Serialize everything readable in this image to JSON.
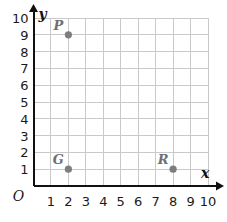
{
  "chart_data": {
    "type": "scatter",
    "title": "",
    "xlabel": "x",
    "ylabel": "y",
    "origin_label": "O",
    "xlim": [
      0,
      10
    ],
    "ylim": [
      0,
      10
    ],
    "grid": true,
    "legend": "none",
    "x_ticks": [
      "1",
      "2",
      "3",
      "4",
      "5",
      "6",
      "7",
      "8",
      "9",
      "10"
    ],
    "y_ticks": [
      "1",
      "2",
      "3",
      "4",
      "5",
      "6",
      "7",
      "8",
      "9",
      "10"
    ],
    "points": [
      {
        "label": "P",
        "x": 2,
        "y": 9
      },
      {
        "label": "G",
        "x": 2,
        "y": 1
      },
      {
        "label": "R",
        "x": 8,
        "y": 1
      }
    ],
    "colors": {
      "point": "#7d7d7d",
      "grid": "#c9c9c9",
      "axis": "#111111",
      "tick_text": "#1a1a1a",
      "point_label": "#6f6f6f",
      "background": "#ffffff"
    }
  }
}
